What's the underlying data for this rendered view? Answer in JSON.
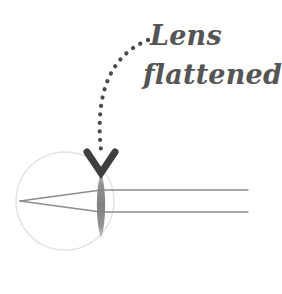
{
  "figure": {
    "background_color": "#ffffff",
    "width": 282,
    "height": 294
  },
  "annotation": {
    "line1": "Lens",
    "line2": "flattened",
    "color": "#555555",
    "font_style": "italic-handwritten",
    "x": 150,
    "y": 45
  },
  "pointer": {
    "name": "dotted-curve-pointer",
    "style": "dotted",
    "dot_color": "#4a4a4a",
    "dot_radius": 2.1,
    "start": [
      148,
      40
    ],
    "end": [
      101,
      150
    ],
    "control1": [
      104,
      58
    ],
    "control2": [
      96,
      104
    ]
  },
  "arrowhead": {
    "name": "chevron-arrowhead",
    "color": "#3f3f3f",
    "direction": "down",
    "apex": [
      101,
      173
    ],
    "left": [
      87,
      152
    ],
    "right": [
      115,
      152
    ],
    "stroke_width": 7
  },
  "eyeball": {
    "name": "eyeball-circle",
    "center": [
      65,
      201
    ],
    "radius": 49,
    "stroke_color": "#e2e2e2",
    "stroke_width": 1.4,
    "fill": "none"
  },
  "lens": {
    "name": "flattened-lens",
    "center": [
      101,
      205
    ],
    "half_height": 33,
    "half_width": 5.5,
    "fill_color": "#8a8a8a",
    "fill_opacity": 0.85,
    "state": "flattened"
  },
  "rays": [
    {
      "name": "upper-light-ray",
      "points": [
        [
          248,
          190
        ],
        [
          101,
          190
        ],
        [
          20,
          201
        ]
      ],
      "color": "#8c8c8c",
      "width": 1.3
    },
    {
      "name": "lower-light-ray",
      "points": [
        [
          248,
          212
        ],
        [
          101,
          212
        ],
        [
          20,
          201
        ]
      ],
      "color": "#8c8c8c",
      "width": 1.3
    }
  ],
  "focal_point": {
    "name": "retina-focal-point",
    "position": [
      20,
      201
    ]
  },
  "colors": {
    "ink": "#555555",
    "ray": "#8c8c8c",
    "lens": "#8a8a8a",
    "eyeball_outline": "#e2e2e2",
    "background": "#ffffff"
  }
}
